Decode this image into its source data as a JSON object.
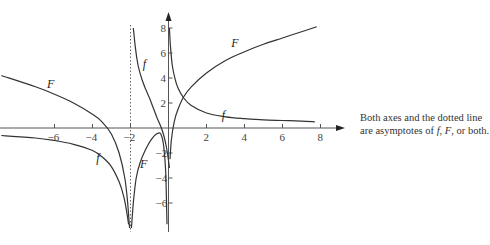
{
  "chart_data": {
    "type": "line",
    "title": "",
    "xlabel": "",
    "ylabel": "",
    "xlim": [
      -8.9,
      9.0
    ],
    "ylim": [
      -7.7,
      8.8
    ],
    "x_ticks": [
      -6,
      -4,
      -2,
      2,
      4,
      6,
      8
    ],
    "y_ticks": [
      8,
      6,
      4,
      2,
      -2,
      -4,
      -6
    ],
    "grid": false,
    "legend": null,
    "asymptotes": {
      "vertical_dotted": -2,
      "axes": [
        "x-axis",
        "y-axis"
      ]
    },
    "series": [
      {
        "name": "F",
        "segments": [
          {
            "x": [
              -8.8,
              -7,
              -6,
              -5,
              -4,
              -3.5,
              -3,
              -2.6,
              -2.3,
              -2.15,
              -2.05
            ],
            "y": [
              4.2,
              3.3,
              2.7,
              2.0,
              1.1,
              0.5,
              -0.5,
              -2.0,
              -4.0,
              -6.0,
              -8.0
            ]
          },
          {
            "x": [
              -1.95,
              -1.85,
              -1.7,
              -1.5,
              -1.2,
              -0.9,
              -0.6,
              -0.4,
              -0.25,
              -0.15,
              -0.08
            ],
            "y": [
              -8.0,
              -6.0,
              -4.0,
              -2.8,
              -1.7,
              -0.9,
              -0.45,
              -0.5,
              -1.5,
              -3.5,
              -7.7
            ]
          },
          {
            "x": [
              0.08,
              0.15,
              0.3,
              0.5,
              0.8,
              1.2,
              2,
              3,
              4,
              5,
              6,
              7,
              7.8
            ],
            "y": [
              -2.5,
              -1.0,
              0.5,
              1.5,
              2.5,
              3.3,
              4.4,
              5.4,
              6.1,
              6.7,
              7.2,
              7.7,
              8.1
            ]
          }
        ],
        "label_positions": [
          {
            "x": -6.4,
            "y": 3.2
          },
          {
            "x": 3.3,
            "y": 6.5
          },
          {
            "x": -1.5,
            "y": -3.2
          }
        ]
      },
      {
        "name": "f",
        "segments": [
          {
            "x": [
              -8.8,
              -7,
              -6,
              -5,
              -4,
              -3.5,
              -3,
              -2.6,
              -2.35,
              -2.2,
              -2.1
            ],
            "y": [
              -0.6,
              -0.8,
              -1.0,
              -1.3,
              -1.8,
              -2.3,
              -3.1,
              -4.3,
              -5.5,
              -6.7,
              -7.7
            ]
          },
          {
            "x": [
              -1.85,
              -1.75,
              -1.6,
              -1.4,
              -1.2,
              -1.0,
              -0.8,
              -0.6,
              -0.4,
              -0.25,
              -0.1,
              0.0,
              0.05
            ],
            "y": [
              8.0,
              6.5,
              5.0,
              3.9,
              3.1,
              2.4,
              1.6,
              0.8,
              0.1,
              -0.6,
              -1.6,
              -2.6,
              -3.2
            ]
          },
          {
            "x": [
              0.05,
              0.1,
              0.2,
              0.35,
              0.5,
              0.8,
              1.2,
              2,
              3,
              4,
              5,
              6,
              7,
              7.7
            ],
            "y": [
              8.0,
              6.6,
              5.0,
              3.9,
              3.2,
              2.4,
              1.8,
              1.2,
              0.9,
              0.75,
              0.65,
              0.6,
              0.55,
              0.5
            ]
          }
        ],
        "label_positions": [
          {
            "x": 2.8,
            "y": 0.7
          },
          {
            "x": -1.35,
            "y": 4.8
          },
          {
            "x": -3.8,
            "y": -2.7
          }
        ]
      }
    ]
  },
  "caption": {
    "line1": "Both axes and the dotted line",
    "line2_prefix": "are asymptotes of ",
    "f": "f",
    "sep1": ", ",
    "F": "F",
    "line2_suffix": ", or both."
  }
}
